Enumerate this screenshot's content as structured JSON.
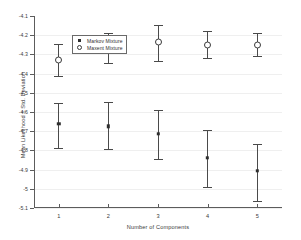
{
  "chart_data": {
    "type": "scatter",
    "title": "",
    "xlabel": "Number of Components",
    "ylabel": "Mean Likelihood ± Std. Deviation",
    "x": [
      1,
      2,
      3,
      4,
      5
    ],
    "xtick_labels": [
      "1",
      "2",
      "3",
      "4",
      "5"
    ],
    "xlim": [
      0.5,
      5.5
    ],
    "ylim": [
      -5.1,
      -4.1
    ],
    "ytick_labels": [
      "-4.1",
      "-4.2",
      "-4.3",
      "-4.4",
      "-4.5",
      "-4.6",
      "-4.7",
      "-4.8",
      "-4.9",
      "-5",
      "-5.1"
    ],
    "ytick_values": [
      -4.1,
      -4.2,
      -4.3,
      -4.4,
      -4.5,
      -4.6,
      -4.7,
      -4.8,
      -4.9,
      -5.0,
      -5.1
    ],
    "grid": false,
    "legend_position": "top-left",
    "series": [
      {
        "name": "Markov Mixture",
        "marker": "square",
        "values": [
          -4.66,
          -4.675,
          -4.712,
          -4.838,
          -4.905
        ],
        "err_low": [
          -4.785,
          -4.795,
          -4.845,
          -4.99,
          -5.065
        ],
        "err_high": [
          -4.555,
          -4.55,
          -4.59,
          -4.695,
          -4.765
        ]
      },
      {
        "name": "Maxent Mixture",
        "marker": "circle",
        "values": [
          -4.33,
          -4.265,
          -4.235,
          -4.25,
          -4.25
        ],
        "err_low": [
          -4.41,
          -4.345,
          -4.335,
          -4.32,
          -4.31
        ],
        "err_high": [
          -4.245,
          -4.19,
          -4.145,
          -4.178,
          -4.188
        ]
      }
    ]
  },
  "legend": {
    "entries": [
      {
        "label": "Markov Mixture",
        "symbol": "square-marker"
      },
      {
        "label": "Maxent Mixture",
        "symbol": "circle-marker"
      }
    ]
  },
  "colors": {
    "axis": "#5c5c5c",
    "marker": "#2e2e2e",
    "errorbar": "#4a4a4a",
    "text": "#3a3a3a",
    "background": "#ffffff"
  }
}
